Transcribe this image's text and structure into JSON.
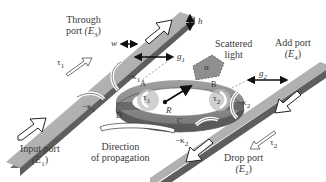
{
  "diagram": {
    "type": "microring-resonator-add-drop-filter",
    "ports": {
      "input": {
        "label": "Input port",
        "field": "(E",
        "sub": "1",
        "close": ")"
      },
      "through": {
        "label": "Through",
        "label2": "port",
        "field": "(E",
        "sub": "3",
        "close": ")"
      },
      "add": {
        "label": "Add port",
        "field": "(E",
        "sub": "4",
        "close": ")"
      },
      "drop": {
        "label": "Drop port",
        "field": "(E",
        "sub": "2",
        "close": ")"
      }
    },
    "annotations": {
      "scattered_light": "Scattered",
      "scattered_light2": "light",
      "direction": "Direction",
      "direction2": "of propagation",
      "alpha": "α",
      "radius": "R",
      "width": "w",
      "height": "h",
      "gap1": "g",
      "gap1_sub": "1",
      "gap2": "g",
      "gap2_sub": "2",
      "tau1_top": "τ",
      "tau1_top_sub": "1",
      "tau2_bottom": "τ",
      "tau2_bottom_sub": "2",
      "tau1_ring": "τ",
      "tau1_ring_sub": "1",
      "tau2_ring": "τ",
      "tau2_ring_sub": "2",
      "kappa1_a": "−κ",
      "kappa1_a_sub": "1",
      "kappa1_b": "−κ",
      "kappa1_b_sub": "1",
      "kappa2_a": "−κ",
      "kappa2_a_sub": "2",
      "kappa2_b": "−κ",
      "kappa2_b_sub": "2",
      "point_a": "A",
      "point_b": "B",
      "point_c": "C",
      "point_d": "D"
    },
    "colors": {
      "waveguide_top": "#a8a8a8",
      "waveguide_side": "#6a6a6a",
      "ring_top": "#9a9a9a",
      "ring_side": "#555555",
      "scatter_patch": "#8f8f8f",
      "arrow_fill": "#ffffff",
      "arrow_stroke": "#222222"
    }
  }
}
